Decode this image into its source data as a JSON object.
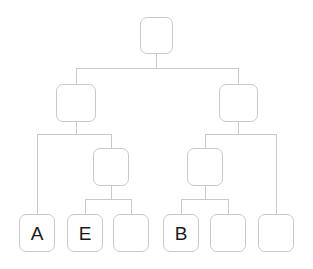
{
  "diagram": {
    "background_color": "#ffffff",
    "stroke_color": "#c9c9c9",
    "label_color": "#1b1b1b",
    "node_shape": "rounded-square",
    "node_fill": "#ffffff",
    "levels": 4,
    "node_count": 11,
    "edge_count": 10,
    "nodes": [
      {
        "id": "root",
        "label": "",
        "level": 0,
        "x": 140,
        "y": 17,
        "w": 33,
        "h": 37
      },
      {
        "id": "l2a",
        "label": "",
        "level": 1,
        "x": 56,
        "y": 84,
        "w": 40,
        "h": 38
      },
      {
        "id": "l2b",
        "label": "",
        "level": 1,
        "x": 219,
        "y": 84,
        "w": 39,
        "h": 38
      },
      {
        "id": "l3a",
        "label": "",
        "level": 2,
        "x": 93,
        "y": 148,
        "w": 36,
        "h": 38
      },
      {
        "id": "l3b",
        "label": "",
        "level": 2,
        "x": 187,
        "y": 148,
        "w": 36,
        "h": 38
      },
      {
        "id": "leaf1",
        "label": "A",
        "level": 3,
        "x": 19,
        "y": 214,
        "w": 36,
        "h": 38
      },
      {
        "id": "leaf2",
        "label": "E",
        "level": 3,
        "x": 67,
        "y": 214,
        "w": 36,
        "h": 38
      },
      {
        "id": "leaf3",
        "label": "",
        "level": 3,
        "x": 113,
        "y": 214,
        "w": 36,
        "h": 38
      },
      {
        "id": "leaf4",
        "label": "B",
        "level": 3,
        "x": 163,
        "y": 214,
        "w": 36,
        "h": 38
      },
      {
        "id": "leaf5",
        "label": "",
        "level": 3,
        "x": 210,
        "y": 214,
        "w": 36,
        "h": 38
      },
      {
        "id": "leaf6",
        "label": "",
        "level": 3,
        "x": 258,
        "y": 214,
        "w": 36,
        "h": 38
      }
    ],
    "edges": [
      {
        "from": "root",
        "to": "l2a"
      },
      {
        "from": "root",
        "to": "l2b"
      },
      {
        "from": "l2a",
        "to": "leaf1"
      },
      {
        "from": "l2a",
        "to": "l3a"
      },
      {
        "from": "l2b",
        "to": "l3b"
      },
      {
        "from": "l2b",
        "to": "leaf6"
      },
      {
        "from": "l3a",
        "to": "leaf2"
      },
      {
        "from": "l3a",
        "to": "leaf3"
      },
      {
        "from": "l3b",
        "to": "leaf4"
      },
      {
        "from": "l3b",
        "to": "leaf5"
      }
    ],
    "labels": {
      "leaf1": "A",
      "leaf2": "E",
      "leaf4": "B"
    }
  }
}
